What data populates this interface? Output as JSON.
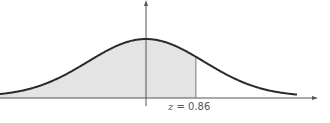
{
  "chart_data": {
    "type": "area",
    "title": "",
    "distribution": "standard normal",
    "mean": 0,
    "sd": 1,
    "shaded_region": {
      "from": "-inf",
      "to": 0.86
    },
    "annotations": [
      {
        "text": "z = 0.86",
        "x": 0.86,
        "position": "below x-axis"
      }
    ],
    "xlabel": "",
    "ylabel": "",
    "xlim": [
      -2.5,
      2.6
    ],
    "grid": false,
    "legend": null
  },
  "label": {
    "var": "z",
    "eq": " = 0.86"
  },
  "colors": {
    "curve": "#2a2a2a",
    "axis": "#555555",
    "shade": "#e4e4e4",
    "z_line": "#777777",
    "label": "#555555"
  },
  "geometry": {
    "origin_x": 146,
    "axis_y": 98,
    "sigma_px": 58,
    "peak_height_px": 59,
    "z_value": 0.86,
    "x_start": 0,
    "x_end": 297,
    "axis_x_end": 318
  }
}
